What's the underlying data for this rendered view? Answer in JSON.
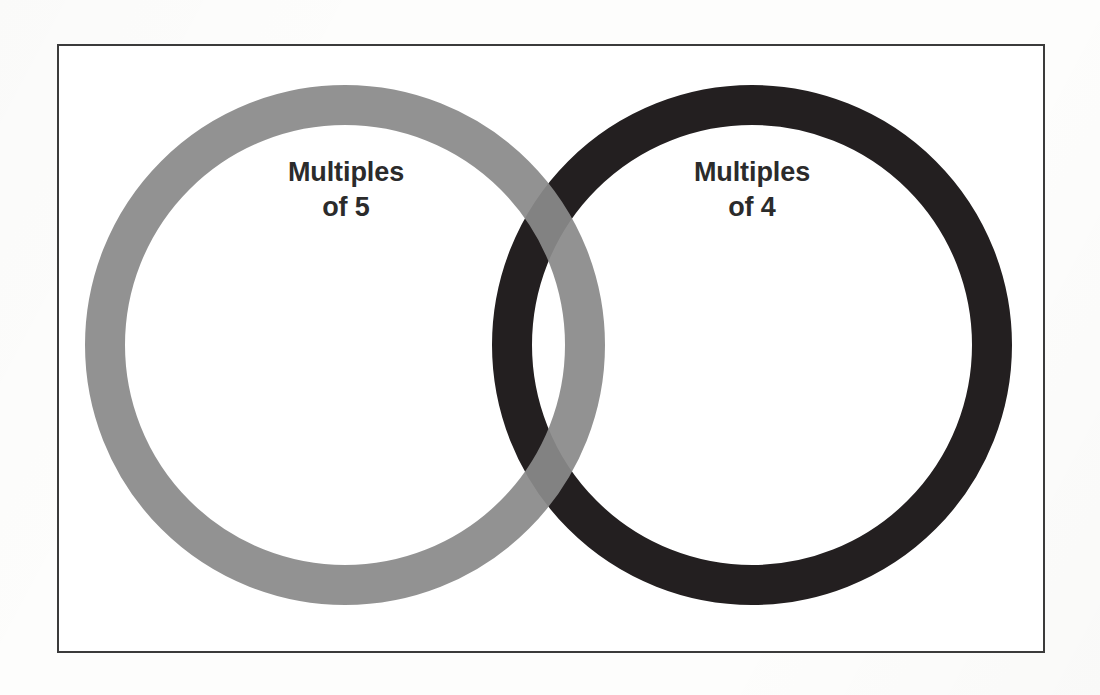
{
  "diagram": {
    "type": "venn",
    "background_color": "#fdfdfc",
    "frame": {
      "name": "universal-set-rectangle",
      "border_color": "#3b3b3b",
      "fill_color": "#ffffff"
    },
    "sets": [
      {
        "id": "left",
        "label": "Multiples\nof 5",
        "label_line_1": "Multiples",
        "label_line_2": "of 5",
        "color": "#8a8a8a",
        "center_x": 345,
        "center_y": 345,
        "outer_radius": 260,
        "stroke_width": 40,
        "draw_order": 2
      },
      {
        "id": "right",
        "label": "Multiples\nof 4",
        "label_line_1": "Multiples",
        "label_line_2": "of 4",
        "color": "#231f20",
        "center_x": 752,
        "center_y": 345,
        "outer_radius": 260,
        "stroke_width": 40,
        "draw_order": 1
      }
    ],
    "intersection": {
      "name": "overlap-region",
      "blend_color": "#5c585a",
      "label": ""
    },
    "label_text_color": "#2b2b2b"
  }
}
